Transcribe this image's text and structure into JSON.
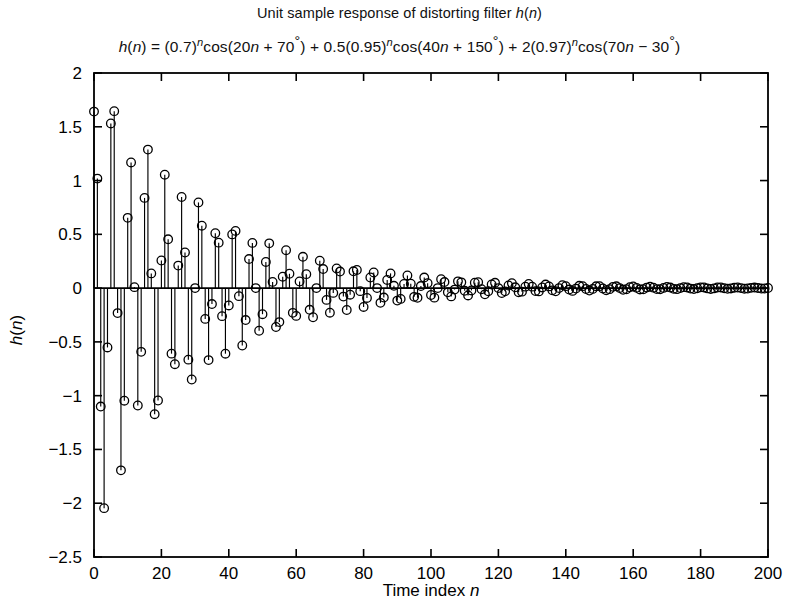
{
  "figure": {
    "width": 799,
    "height": 606,
    "background": "#ffffff",
    "foreground": "#000000"
  },
  "title": "Unit sample response of distorting filter h(n)",
  "subtitle": "h(n) = (0.7)ⁿcos(20n + 70°) + 0.5(0.95)ⁿcos(40n + 150°) + 2(0.97)ⁿcos(70n − 30°)",
  "subtitle_parts": {
    "lhs": "h(n) = ",
    "term1": "(0.7)ⁿcos(20n + 70°)",
    "plus1": " + ",
    "term2": "0.5(0.95)ⁿcos(40n + 150°)",
    "plus2": " + ",
    "term3": "2(0.97)ⁿcos(70n − 30°)"
  },
  "chart_data": {
    "type": "scatter",
    "plot_style": "stem",
    "title": "Unit sample response of distorting filter h(n)",
    "subtitle": "h(n) = (0.7)^n cos(20n + 70°) + 0.5(0.95)^n cos(40n + 150°) + 2(0.97)^n cos(70n − 30°)",
    "xlabel": "Time index n",
    "ylabel": "h(n)",
    "xlim": [
      0,
      200
    ],
    "ylim": [
      -2.5,
      2.0
    ],
    "xticks": [
      0,
      20,
      40,
      60,
      80,
      100,
      120,
      140,
      160,
      180,
      200
    ],
    "xticklabels": [
      "0",
      "20",
      "40",
      "60",
      "80",
      "100",
      "120",
      "140",
      "160",
      "180",
      "200"
    ],
    "yticks": [
      2,
      1.5,
      1,
      0.5,
      0,
      -0.5,
      -1,
      -1.5,
      -2,
      -2.5
    ],
    "yticklabels": [
      "2",
      "1.5",
      "1",
      "0.5",
      "0",
      "−0.5",
      "−1",
      "−1.5",
      "−2",
      "−2.5"
    ],
    "grid": false,
    "legend": null,
    "marker": "circle-open",
    "marker_size": 5,
    "line_color": "#000000",
    "baseline_y": 0,
    "formula": {
      "terms": [
        {
          "amplitude": 1.0,
          "decay": 0.7,
          "freq_deg_per_sample": 20,
          "phase_deg": 70
        },
        {
          "amplitude": 0.5,
          "decay": 0.95,
          "freq_deg_per_sample": 40,
          "phase_deg": 150
        },
        {
          "amplitude": 2.0,
          "decay": 0.97,
          "freq_deg_per_sample": 70,
          "phase_deg": -30
        }
      ]
    },
    "n_samples": 201,
    "x": "generated: n = 0..200 integer step 1",
    "values": "generated from formula terms"
  },
  "axes": {
    "xlabel": "Time index n",
    "ylabel": "h(n)",
    "xticklabels": [
      "0",
      "20",
      "40",
      "60",
      "80",
      "100",
      "120",
      "140",
      "160",
      "180",
      "200"
    ],
    "yticklabels": [
      "2",
      "1.5",
      "1",
      "0.5",
      "0",
      "−0.5",
      "−1",
      "−1.5",
      "−2",
      "−2.5"
    ]
  }
}
